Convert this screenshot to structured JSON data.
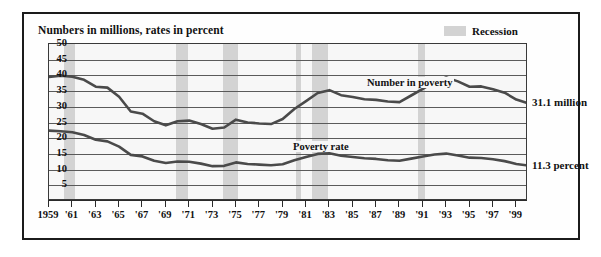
{
  "figure": {
    "title": "Numbers in millions, rates in percent",
    "legend": {
      "label": "Recession",
      "swatch_color": "#d3d3d3"
    }
  },
  "chart_data": {
    "type": "line",
    "title": "Numbers in millions, rates in percent",
    "xlabel": "",
    "ylabel": "",
    "ylim": [
      0,
      50
    ],
    "yticks": [
      50,
      45,
      40,
      35,
      30,
      25,
      20,
      15,
      10,
      5
    ],
    "grid": true,
    "legend_position": "top-right",
    "xlim": [
      1959,
      2000
    ],
    "x": [
      1959,
      1960,
      1961,
      1962,
      1963,
      1964,
      1965,
      1966,
      1967,
      1968,
      1969,
      1970,
      1971,
      1972,
      1973,
      1974,
      1975,
      1976,
      1977,
      1978,
      1979,
      1980,
      1981,
      1982,
      1983,
      1984,
      1985,
      1986,
      1987,
      1988,
      1989,
      1990,
      1991,
      1992,
      1993,
      1994,
      1995,
      1996,
      1997,
      1998,
      1999,
      2000
    ],
    "xtick_labels": [
      "1959",
      "'61",
      "'63",
      "'65",
      "'67",
      "'69",
      "'71",
      "'73",
      "'75",
      "'77",
      "'79",
      "'81",
      "'83",
      "'85",
      "'87",
      "'89",
      "'91",
      "'93",
      "'95",
      "'97",
      "'99"
    ],
    "xtick_values": [
      1959,
      1961,
      1963,
      1965,
      1967,
      1969,
      1971,
      1973,
      1975,
      1977,
      1979,
      1981,
      1983,
      1985,
      1987,
      1989,
      1991,
      1993,
      1995,
      1997,
      1999
    ],
    "series": [
      {
        "name": "Number in poverty",
        "annotation": "Number in poverty",
        "units": "millions",
        "end_label": "31.1 million",
        "color": "#4a4a4a",
        "values": [
          39.5,
          39.9,
          39.6,
          38.6,
          36.4,
          36.1,
          33.2,
          28.5,
          27.8,
          25.4,
          24.1,
          25.4,
          25.6,
          24.5,
          23.0,
          23.4,
          25.9,
          25.0,
          24.7,
          24.5,
          26.1,
          29.3,
          31.8,
          34.4,
          35.3,
          33.7,
          33.1,
          32.4,
          32.2,
          31.7,
          31.5,
          33.6,
          35.7,
          38.0,
          39.3,
          38.1,
          36.4,
          36.5,
          35.6,
          34.5,
          32.3,
          31.1
        ]
      },
      {
        "name": "Poverty rate",
        "annotation": "Poverty rate",
        "units": "percent",
        "end_label": "11.3 percent",
        "color": "#4a4a4a",
        "values": [
          22.4,
          22.2,
          21.9,
          21.0,
          19.5,
          19.0,
          17.3,
          14.7,
          14.2,
          12.8,
          12.1,
          12.6,
          12.5,
          11.9,
          11.1,
          11.2,
          12.3,
          11.8,
          11.6,
          11.4,
          11.7,
          13.0,
          14.0,
          15.0,
          15.2,
          14.4,
          14.0,
          13.6,
          13.4,
          13.0,
          12.8,
          13.5,
          14.2,
          14.8,
          15.1,
          14.5,
          13.8,
          13.7,
          13.3,
          12.7,
          11.8,
          11.3
        ]
      }
    ],
    "recessions": [
      {
        "start": 1960.3,
        "end": 1961.2
      },
      {
        "start": 1969.9,
        "end": 1970.9
      },
      {
        "start": 1973.9,
        "end": 1975.2
      },
      {
        "start": 1980.1,
        "end": 1980.6
      },
      {
        "start": 1981.5,
        "end": 1982.9
      },
      {
        "start": 1990.6,
        "end": 1991.2
      }
    ]
  }
}
